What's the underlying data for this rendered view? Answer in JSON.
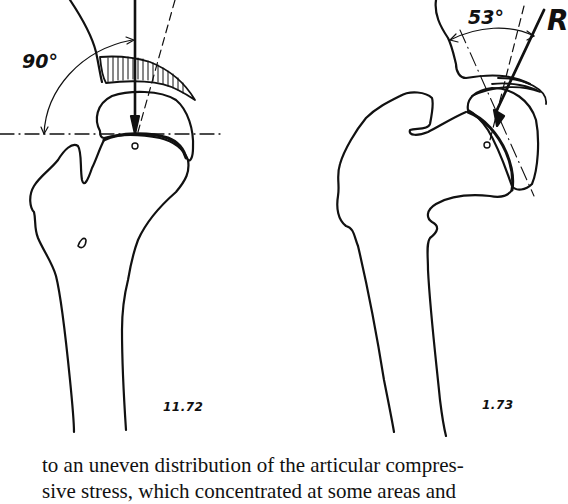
{
  "figure": {
    "left_panel": {
      "angle_label": "90°",
      "figure_number": "11.72"
    },
    "right_panel": {
      "angle_label": "53°",
      "force_label": "R",
      "figure_number": "1.73"
    },
    "colors": {
      "ink": "#111111",
      "background": "#ffffff"
    }
  },
  "text": {
    "lines": [
      "to an uneven distribution of the articular compres-",
      "sive stress, which concentrated at some areas and"
    ]
  }
}
